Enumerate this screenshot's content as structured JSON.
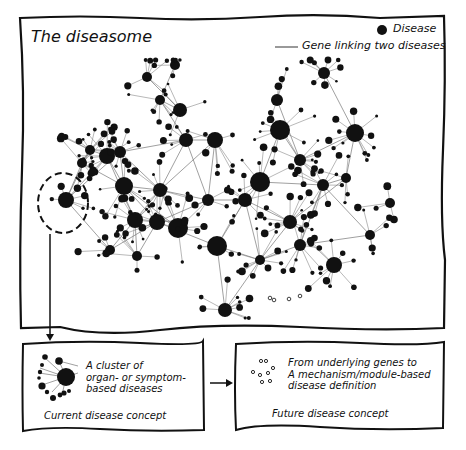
{
  "title": "The diseasome",
  "legend": {
    "disease_label": "Disease",
    "gene_label": "Gene linking two diseases"
  },
  "left_box": {
    "description_lines": [
      "A cluster of",
      "organ- or symptom-",
      "based diseases"
    ],
    "caption": "Current disease concept"
  },
  "right_box": {
    "description_lines": [
      "From underlying genes to",
      "A mechanism/module-based",
      "disease definition"
    ],
    "caption": "Future disease concept"
  },
  "colors": {
    "ink": "#111111",
    "edge": "#888888",
    "background": "#ffffff"
  }
}
